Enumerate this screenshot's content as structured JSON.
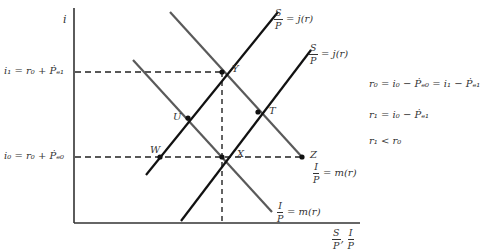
{
  "diagram": {
    "axes": {
      "y_label": "i",
      "x_label_1_num": "S",
      "x_label_1_den": "P",
      "x_label_sep": ",",
      "x_label_2_num": "I",
      "x_label_2_den": "P"
    },
    "levels": {
      "i1": "i₁ = r₀ + Ṗₑ₁",
      "i0": "i₀ = r₀ + Ṗₑ₀"
    },
    "curves": {
      "supply_1": {
        "num": "S",
        "den": "P",
        "rhs": "= j(r)"
      },
      "supply_2": {
        "num": "S",
        "den": "P",
        "rhs": "= j(r)"
      },
      "demand_1": {
        "num": "I",
        "den": "P",
        "rhs": "= m(r)"
      },
      "demand_2": {
        "num": "I",
        "den": "P",
        "rhs": "= m(r)"
      }
    },
    "points": {
      "Y": "Y",
      "T": "T",
      "U": "U",
      "W": "W",
      "X": "X",
      "Z": "Z"
    },
    "equations": [
      "r₀ = i₀ − Ṗₑ₀ = i₁ − Ṗₑ₁",
      "r₁ = i₀ − Ṗₑ₁",
      "r₁ < r₀"
    ],
    "colors": {
      "supply": "#111111",
      "demand": "#555555",
      "axis": "#333333"
    }
  }
}
